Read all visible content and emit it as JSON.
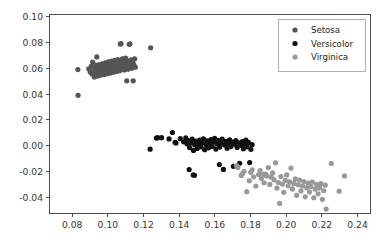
{
  "figure": {
    "background": "#ffffff",
    "width": 383,
    "height": 251
  },
  "axes": {
    "frame_color": "#4d4d4d",
    "left_px": 49,
    "right_px": 370,
    "top_px": 14,
    "bottom_px": 213
  },
  "legend": {
    "position": "upper right",
    "frame_color": "#b0b0b0",
    "entries": [
      {
        "label": "Setosa",
        "color": "#555555",
        "marker": "circle"
      },
      {
        "label": "Versicolor",
        "color": "#101010",
        "marker": "circle"
      },
      {
        "label": "Virginica",
        "color": "#999999",
        "marker": "circle"
      }
    ]
  },
  "chart_data": {
    "type": "scatter",
    "title": "",
    "xlabel": "",
    "ylabel": "",
    "xlim": [
      0.067,
      0.247
    ],
    "ylim": [
      -0.052,
      0.102
    ],
    "grid": false,
    "legend_position": "upper right",
    "marker_size_px": 5.2,
    "xticks": [
      0.08,
      0.1,
      0.12,
      0.14,
      0.16,
      0.18,
      0.2,
      0.22,
      0.24
    ],
    "xtick_labels": [
      "0.08",
      "0.10",
      "0.12",
      "0.14",
      "0.16",
      "0.18",
      "0.20",
      "0.22",
      "0.24"
    ],
    "yticks": [
      -0.04,
      -0.02,
      0.0,
      0.02,
      0.04,
      0.06,
      0.08,
      0.1
    ],
    "ytick_labels": [
      "-0.04",
      "-0.02",
      "0.00",
      "0.02",
      "0.04",
      "0.06",
      "0.08",
      "0.10"
    ],
    "series": [
      {
        "name": "Setosa",
        "color": "#555555",
        "points": [
          [
            0.0832,
            0.059
          ],
          [
            0.0833,
            0.0391
          ],
          [
            0.0893,
            0.0596
          ],
          [
            0.0901,
            0.0572
          ],
          [
            0.0908,
            0.0617
          ],
          [
            0.0912,
            0.0556
          ],
          [
            0.0915,
            0.0648
          ],
          [
            0.0921,
            0.0601
          ],
          [
            0.0924,
            0.0533
          ],
          [
            0.0928,
            0.0578
          ],
          [
            0.0931,
            0.0625
          ],
          [
            0.0935,
            0.056
          ],
          [
            0.0938,
            0.0688
          ],
          [
            0.0941,
            0.0604
          ],
          [
            0.0944,
            0.054
          ],
          [
            0.0948,
            0.0582
          ],
          [
            0.0951,
            0.0629
          ],
          [
            0.0955,
            0.0566
          ],
          [
            0.0958,
            0.061
          ],
          [
            0.0961,
            0.0547
          ],
          [
            0.0965,
            0.0592
          ],
          [
            0.0968,
            0.0635
          ],
          [
            0.0972,
            0.0571
          ],
          [
            0.0975,
            0.0614
          ],
          [
            0.0979,
            0.0551
          ],
          [
            0.0982,
            0.0598
          ],
          [
            0.0986,
            0.0642
          ],
          [
            0.0989,
            0.0578
          ],
          [
            0.0993,
            0.062
          ],
          [
            0.0996,
            0.0557
          ],
          [
            0.1,
            0.0604
          ],
          [
            0.1003,
            0.065
          ],
          [
            0.1007,
            0.0584
          ],
          [
            0.101,
            0.0627
          ],
          [
            0.1014,
            0.0563
          ],
          [
            0.1017,
            0.0609
          ],
          [
            0.1021,
            0.0655
          ],
          [
            0.1024,
            0.059
          ],
          [
            0.1028,
            0.0633
          ],
          [
            0.1031,
            0.0569
          ],
          [
            0.1035,
            0.0615
          ],
          [
            0.1038,
            0.0661
          ],
          [
            0.1042,
            0.0596
          ],
          [
            0.1045,
            0.0639
          ],
          [
            0.1049,
            0.0575
          ],
          [
            0.1052,
            0.0621
          ],
          [
            0.1056,
            0.0667
          ],
          [
            0.1059,
            0.0602
          ],
          [
            0.1063,
            0.0645
          ],
          [
            0.1066,
            0.0581
          ],
          [
            0.107,
            0.0788
          ],
          [
            0.1074,
            0.079
          ],
          [
            0.1078,
            0.0627
          ],
          [
            0.1081,
            0.0673
          ],
          [
            0.1085,
            0.0608
          ],
          [
            0.1088,
            0.0651
          ],
          [
            0.1092,
            0.0587
          ],
          [
            0.1095,
            0.0633
          ],
          [
            0.1099,
            0.0679
          ],
          [
            0.1102,
            0.0614
          ],
          [
            0.1106,
            0.0503
          ],
          [
            0.111,
            0.0657
          ],
          [
            0.1113,
            0.0593
          ],
          [
            0.1117,
            0.0639
          ],
          [
            0.112,
            0.0786
          ],
          [
            0.1124,
            0.0789
          ],
          [
            0.1128,
            0.062
          ],
          [
            0.1131,
            0.0666
          ],
          [
            0.1135,
            0.0601
          ],
          [
            0.1139,
            0.0645
          ],
          [
            0.1142,
            0.0503
          ],
          [
            0.1146,
            0.0627
          ],
          [
            0.115,
            0.0672
          ],
          [
            0.1154,
            0.0608
          ],
          [
            0.124,
            0.0759
          ]
        ]
      },
      {
        "name": "Versicolor",
        "color": "#101010",
        "points": [
          [
            0.1237,
            -0.0026
          ],
          [
            0.1272,
            0.006
          ],
          [
            0.1279,
            0.0063
          ],
          [
            0.1301,
            0.0063
          ],
          [
            0.1343,
            0.0053
          ],
          [
            0.1362,
            0.0103
          ],
          [
            0.1377,
            0.0027
          ],
          [
            0.1382,
            0.0021
          ],
          [
            0.1406,
            0.0055
          ],
          [
            0.1425,
            0.0031
          ],
          [
            0.1437,
            0.0062
          ],
          [
            0.1444,
            0.0015
          ],
          [
            0.1451,
            0.004
          ],
          [
            0.1458,
            -0.0014
          ],
          [
            0.1466,
            0.0022
          ],
          [
            0.1473,
            0.0051
          ],
          [
            0.148,
            -0.0036
          ],
          [
            0.1487,
            0.0009
          ],
          [
            0.1494,
            0.0037
          ],
          [
            0.1501,
            -0.002
          ],
          [
            0.1508,
            0.0016
          ],
          [
            0.1515,
            0.0044
          ],
          [
            0.1522,
            -0.0008
          ],
          [
            0.1529,
            0.0026
          ],
          [
            0.1536,
            0.0053
          ],
          [
            0.1543,
            -0.003
          ],
          [
            0.155,
            0.0011
          ],
          [
            0.1557,
            0.0039
          ],
          [
            0.1564,
            -0.0016
          ],
          [
            0.1571,
            0.002
          ],
          [
            0.1578,
            0.0048
          ],
          [
            0.1585,
            -0.0004
          ],
          [
            0.1592,
            0.003
          ],
          [
            0.1599,
            0.0057
          ],
          [
            0.1606,
            -0.0025
          ],
          [
            0.1613,
            0.0014
          ],
          [
            0.162,
            0.0042
          ],
          [
            0.1627,
            -0.001
          ],
          [
            0.1634,
            0.0024
          ],
          [
            0.1641,
            0.0051
          ],
          [
            0.1648,
            -0.0183
          ],
          [
            0.1655,
            0.0007
          ],
          [
            0.1662,
            0.0035
          ],
          [
            0.1669,
            -0.0018
          ],
          [
            0.1676,
            0.0019
          ],
          [
            0.1683,
            0.0046
          ],
          [
            0.169,
            -0.0006
          ],
          [
            0.1697,
            0.0028
          ],
          [
            0.1704,
            -0.0159
          ],
          [
            0.1711,
            0.0012
          ],
          [
            0.1718,
            0.004
          ],
          [
            0.1725,
            -0.0013
          ],
          [
            0.1732,
            0.0023
          ],
          [
            0.1739,
            -0.0135
          ],
          [
            0.1746,
            0.0004
          ],
          [
            0.1753,
            0.0032
          ],
          [
            0.176,
            -0.0022
          ],
          [
            0.1767,
            0.0016
          ],
          [
            0.1774,
            0.0044
          ],
          [
            0.1781,
            -0.0008
          ],
          [
            0.1788,
            0.0026
          ],
          [
            0.1795,
            -0.013
          ],
          [
            0.1802,
            -0.0027
          ],
          [
            0.1809,
            0.0009
          ],
          [
            0.1456,
            -0.0184
          ],
          [
            0.1479,
            -0.0225
          ],
          [
            0.1486,
            -0.0228
          ],
          [
            0.1625,
            -0.0145
          ]
        ]
      },
      {
        "name": "Virginica",
        "color": "#999999",
        "points": [
          [
            0.1722,
            -0.0154
          ],
          [
            0.1729,
            -0.0168
          ],
          [
            0.1748,
            -0.0229
          ],
          [
            0.1756,
            -0.0215
          ],
          [
            0.1764,
            -0.0197
          ],
          [
            0.1779,
            -0.0355
          ],
          [
            0.1793,
            -0.0271
          ],
          [
            0.1801,
            -0.0205
          ],
          [
            0.1809,
            -0.0186
          ],
          [
            0.1817,
            -0.024
          ],
          [
            0.183,
            -0.0311
          ],
          [
            0.1845,
            -0.0223
          ],
          [
            0.1853,
            -0.0192
          ],
          [
            0.1861,
            -0.0253
          ],
          [
            0.1876,
            -0.0286
          ],
          [
            0.1884,
            -0.0218
          ],
          [
            0.1892,
            -0.0234
          ],
          [
            0.19,
            -0.0168
          ],
          [
            0.1908,
            -0.0299
          ],
          [
            0.1916,
            -0.0243
          ],
          [
            0.1924,
            -0.021
          ],
          [
            0.1932,
            -0.0262
          ],
          [
            0.194,
            -0.0131
          ],
          [
            0.1948,
            -0.0327
          ],
          [
            0.1956,
            -0.0284
          ],
          [
            0.1963,
            -0.0446
          ],
          [
            0.1971,
            -0.0238
          ],
          [
            0.1979,
            -0.0296
          ],
          [
            0.1987,
            -0.036
          ],
          [
            0.1995,
            -0.0268
          ],
          [
            0.2003,
            -0.0225
          ],
          [
            0.2011,
            -0.031
          ],
          [
            0.2019,
            -0.0279
          ],
          [
            0.2027,
            -0.0172
          ],
          [
            0.2035,
            -0.0334
          ],
          [
            0.2043,
            -0.0291
          ],
          [
            0.2051,
            -0.0256
          ],
          [
            0.2059,
            -0.0383
          ],
          [
            0.2067,
            -0.0302
          ],
          [
            0.2075,
            -0.0265
          ],
          [
            0.2083,
            -0.0349
          ],
          [
            0.2091,
            -0.0311
          ],
          [
            0.2099,
            -0.0277
          ],
          [
            0.2107,
            -0.0395
          ],
          [
            0.2115,
            -0.0324
          ],
          [
            0.2123,
            -0.0288
          ],
          [
            0.2131,
            -0.0358
          ],
          [
            0.2139,
            -0.0315
          ],
          [
            0.2147,
            -0.0281
          ],
          [
            0.2155,
            -0.0402
          ],
          [
            0.2163,
            -0.0336
          ],
          [
            0.2171,
            -0.0299
          ],
          [
            0.2179,
            -0.0371
          ],
          [
            0.2187,
            -0.0327
          ],
          [
            0.2195,
            -0.0293
          ],
          [
            0.2203,
            -0.0414
          ],
          [
            0.2211,
            -0.0348
          ],
          [
            0.2219,
            -0.0305
          ],
          [
            0.2224,
            -0.049
          ],
          [
            0.2253,
            -0.0137
          ],
          [
            0.2297,
            -0.0351
          ],
          [
            0.2327,
            -0.0233
          ],
          [
            0.1873,
            -0.0221
          ],
          [
            0.1889,
            -0.0229
          ]
        ]
      }
    ]
  }
}
